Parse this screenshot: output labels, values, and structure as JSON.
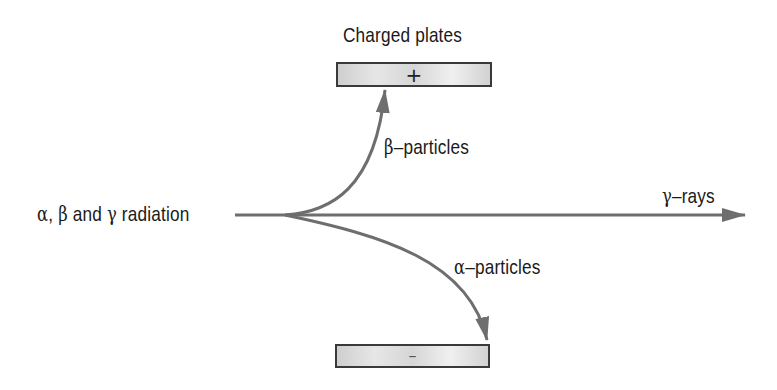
{
  "diagram": {
    "title": "Charged plates",
    "source": {
      "label_parts": [
        "α",
        ", ",
        "β",
        " and ",
        "γ",
        " radiation"
      ],
      "label": "α, β and γ radiation"
    },
    "plates": {
      "top": {
        "sign": "+",
        "charge": "positive"
      },
      "bottom": {
        "sign": "–",
        "charge": "negative"
      }
    },
    "paths": {
      "beta": {
        "symbol": "β",
        "text": "–particles",
        "label": "β–particles",
        "deflection": "toward positive plate (up)"
      },
      "gamma": {
        "symbol": "γ",
        "text": "–rays",
        "label": "γ–rays",
        "deflection": "none (straight)"
      },
      "alpha": {
        "symbol": "α",
        "text": "–particles",
        "label": "α–particles",
        "deflection": "toward negative plate (down)"
      }
    },
    "colors": {
      "line": "#6e6e6e",
      "text": "#1a1a1a",
      "plate_border": "#3a3a3a",
      "plate_fill": "#dcdcdc"
    }
  }
}
